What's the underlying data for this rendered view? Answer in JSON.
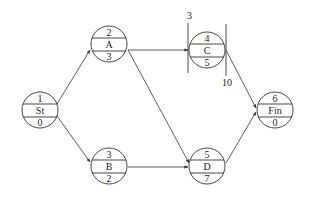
{
  "diagram": {
    "type": "activity-on-node network",
    "nodes": [
      {
        "id": "St",
        "top": "1",
        "label": "St",
        "bottom": "0",
        "cx": 40,
        "cy": 110
      },
      {
        "id": "A",
        "top": "2",
        "label": "A",
        "bottom": "3",
        "cx": 109,
        "cy": 44
      },
      {
        "id": "B",
        "top": "3",
        "label": "B",
        "bottom": "2",
        "cx": 109,
        "cy": 166
      },
      {
        "id": "C",
        "top": "4",
        "label": "C",
        "bottom": "5",
        "cx": 207,
        "cy": 50
      },
      {
        "id": "D",
        "top": "5",
        "label": "D",
        "bottom": "7",
        "cx": 207,
        "cy": 166
      },
      {
        "id": "Fin",
        "top": "6",
        "label": "Fin",
        "bottom": "0",
        "cx": 275,
        "cy": 110
      }
    ],
    "edges": [
      {
        "from": "St",
        "to": "A"
      },
      {
        "from": "St",
        "to": "B"
      },
      {
        "from": "A",
        "to": "C"
      },
      {
        "from": "A",
        "to": "D"
      },
      {
        "from": "B",
        "to": "D"
      },
      {
        "from": "C",
        "to": "Fin"
      },
      {
        "from": "D",
        "to": "Fin"
      }
    ],
    "time_window": {
      "node": "C",
      "start_label": "3",
      "end_label": "10"
    }
  }
}
